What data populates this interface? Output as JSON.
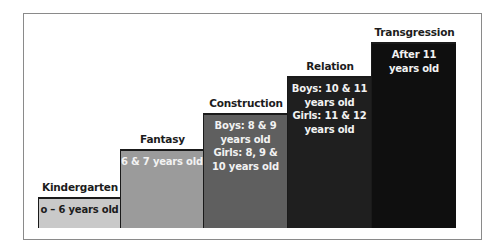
{
  "diagram": {
    "type": "staircase",
    "steps": [
      {
        "title": "Kindergarten",
        "lines": [
          "o – 6 years old"
        ],
        "color": "#c9c9c9",
        "text_color": "#1c1c1c",
        "box": {
          "left": 38,
          "top": 197,
          "width": 82,
          "height": 31
        }
      },
      {
        "title": "Fantasy",
        "lines": [
          "6 & 7 years old"
        ],
        "color": "#9b9b9b",
        "text_color": "#f2f2f2",
        "box": {
          "left": 120,
          "top": 149,
          "width": 83,
          "height": 79
        }
      },
      {
        "title": "Construction",
        "lines": [
          "Boys: 8 & 9",
          "years old",
          "Girls: 8, 9 &",
          "10 years old"
        ],
        "color": "#5f5f5f",
        "text_color": "#f2f2f2",
        "box": {
          "left": 203,
          "top": 113,
          "width": 84,
          "height": 115
        }
      },
      {
        "title": "Relation",
        "lines": [
          "Boys: 10 & 11",
          "years old",
          "Girls: 11 & 12",
          "years old"
        ],
        "color": "#1f1f1f",
        "text_color": "#f2f2f2",
        "box": {
          "left": 287,
          "top": 76,
          "width": 84,
          "height": 152
        }
      },
      {
        "title": "Transgression",
        "lines": [
          "After 11",
          "years old"
        ],
        "color": "#0f0f0f",
        "text_color": "#f2f2f2",
        "box": {
          "left": 371,
          "top": 42,
          "width": 85,
          "height": 186
        }
      }
    ]
  }
}
